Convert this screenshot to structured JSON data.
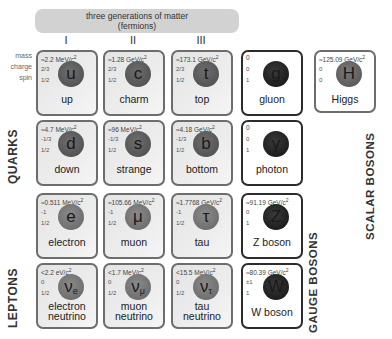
{
  "header": {
    "title_line1": "three generations of matter",
    "title_line2": "(fermions)",
    "generations": [
      "I",
      "II",
      "III"
    ]
  },
  "row_labels": {
    "mass": "mass",
    "charge": "charge",
    "spin": "spin"
  },
  "group_labels": {
    "quarks": "QUARKS",
    "leptons": "LEPTONS",
    "gauge_bosons": "GAUGE BOSONS",
    "scalar_bosons": "SCALAR BOSONS"
  },
  "particles": {
    "up": {
      "mass": "≈2.2 MeV/c",
      "charge": "2/3",
      "spin": "1/2",
      "symbol": "u",
      "sub": "",
      "name": "up"
    },
    "charm": {
      "mass": "≈1.28 GeV/c",
      "charge": "2/3",
      "spin": "1/2",
      "symbol": "c",
      "sub": "",
      "name": "charm"
    },
    "top": {
      "mass": "≈173.1 GeV/c",
      "charge": "2/3",
      "spin": "1/2",
      "symbol": "t",
      "sub": "",
      "name": "top"
    },
    "gluon": {
      "mass": "0",
      "charge": "0",
      "spin": "1",
      "symbol": "g",
      "sub": "",
      "name": "gluon"
    },
    "higgs": {
      "mass": "≈125.09 GeV/c",
      "charge": "0",
      "spin": "0",
      "symbol": "H",
      "sub": "",
      "name": "Higgs"
    },
    "down": {
      "mass": "≈4.7 MeV/c",
      "charge": "-1/3",
      "spin": "1/2",
      "symbol": "d",
      "sub": "",
      "name": "down"
    },
    "strange": {
      "mass": "≈96 MeV/c",
      "charge": "-1/3",
      "spin": "1/2",
      "symbol": "s",
      "sub": "",
      "name": "strange"
    },
    "bottom": {
      "mass": "≈4.18 GeV/c",
      "charge": "-1/3",
      "spin": "1/2",
      "symbol": "b",
      "sub": "",
      "name": "bottom"
    },
    "photon": {
      "mass": "0",
      "charge": "0",
      "spin": "1",
      "symbol": "γ",
      "sub": "",
      "name": "photon"
    },
    "electron": {
      "mass": "≈0.511 MeV/c",
      "charge": "-1",
      "spin": "1/2",
      "symbol": "e",
      "sub": "",
      "name": "electron"
    },
    "muon": {
      "mass": "≈105.66 MeV/c",
      "charge": "-1",
      "spin": "1/2",
      "symbol": "μ",
      "sub": "",
      "name": "muon"
    },
    "tau": {
      "mass": "≈1.7768 GeV/c",
      "charge": "-1",
      "spin": "1/2",
      "symbol": "τ",
      "sub": "",
      "name": "tau"
    },
    "zboson": {
      "mass": "≈91.19 GeV/c",
      "charge": "0",
      "spin": "1",
      "symbol": "Z",
      "sub": "",
      "name": "Z boson"
    },
    "nu_e": {
      "mass": "<2.2 eV/c",
      "charge": "0",
      "spin": "1/2",
      "symbol": "ν",
      "sub": "e",
      "name1": "electron",
      "name2": "neutrino"
    },
    "nu_mu": {
      "mass": "<1.7 MeV/c",
      "charge": "0",
      "spin": "1/2",
      "symbol": "ν",
      "sub": "μ",
      "name1": "muon",
      "name2": "neutrino"
    },
    "nu_tau": {
      "mass": "<15.5 MeV/c",
      "charge": "0",
      "spin": "1/2",
      "symbol": "ν",
      "sub": "τ",
      "name1": "tau",
      "name2": "neutrino"
    },
    "wboson": {
      "mass": "≈80.39 GeV/c",
      "charge": "±1",
      "spin": "1",
      "symbol": "W",
      "sub": "",
      "name": "W boson"
    }
  },
  "mass_exponent": "2",
  "colors": {
    "fermion_border": "#6d6d6d",
    "gauge_border": "#2c2c2c",
    "banner_bg": "#d2d2d2",
    "quark_ball": "#555555",
    "lepton_ball": "#707070",
    "gauge_ball": "#1e1e1e"
  }
}
